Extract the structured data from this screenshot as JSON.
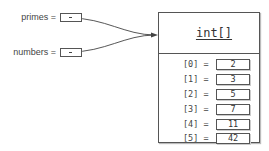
{
  "variables": [
    {
      "name": "primes",
      "label": "primes ="
    },
    {
      "name": "numbers",
      "label": "numbers ="
    }
  ],
  "array": {
    "type": "int[]",
    "elements": [
      {
        "index": "[0]  =",
        "value": "2"
      },
      {
        "index": "[1]  =",
        "value": "3"
      },
      {
        "index": "[2]  =",
        "value": "5"
      },
      {
        "index": "[3]  =",
        "value": "7"
      },
      {
        "index": "[4]  =",
        "value": "11"
      },
      {
        "index": "[5]  =",
        "value": "42"
      }
    ]
  },
  "colors": {
    "line": "#555555",
    "text": "#444444",
    "background": "#ffffff"
  }
}
